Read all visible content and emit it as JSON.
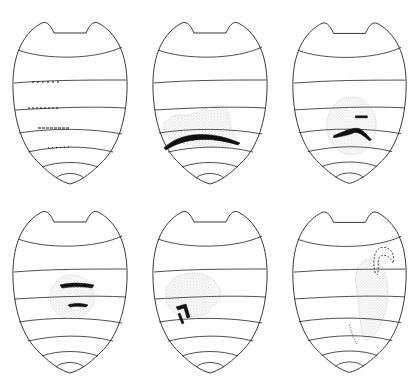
{
  "figure": {
    "layout": {
      "rows": 2,
      "cols": 3
    },
    "panels": [
      {
        "id": 1,
        "position": "top-left",
        "feature": "short dark tick marks along segment borders 3-5 and faint marks on border 6",
        "stipple": "none"
      },
      {
        "id": 2,
        "position": "top-middle",
        "feature": "long dark arc across lower-middle segment",
        "stipple": "irregular patch above arc"
      },
      {
        "id": 3,
        "position": "top-right",
        "feature": "two dark curved marks (short upper, chevron lower)",
        "stipple": "oval patch right of center"
      },
      {
        "id": 4,
        "position": "bottom-left",
        "feature": "two dark dash marks on segment borders",
        "stipple": "circular patch center"
      },
      {
        "id": 5,
        "position": "bottom-middle",
        "feature": "dark angular hook-shaped mark",
        "stipple": "rounded irregular patch left of center"
      },
      {
        "id": 6,
        "position": "bottom-right",
        "feature": "thin looping coiled outline at top with dotted tail",
        "stipple": "elongated curved patch right side"
      }
    ],
    "colors": {
      "line": "#222222",
      "mark": "#111111",
      "stipple": "#888888",
      "background": "#ffffff"
    }
  }
}
